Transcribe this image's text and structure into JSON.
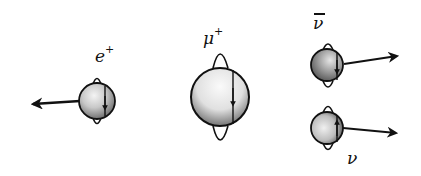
{
  "diagram": {
    "type": "particle-spin-helicity",
    "particles": [
      {
        "id": "positron",
        "symbol": "e",
        "superscript": "+",
        "label": "e+",
        "spin_direction": "down",
        "momentum_direction": "left"
      },
      {
        "id": "muon",
        "symbol": "μ",
        "superscript": "+",
        "label": "μ+",
        "spin_direction": "down",
        "momentum_direction": "none"
      },
      {
        "id": "antineutrino",
        "symbol": "ν",
        "overbar": true,
        "label": "ν̄",
        "spin_direction": "down",
        "momentum_direction": "right"
      },
      {
        "id": "neutrino",
        "symbol": "ν",
        "label": "ν",
        "spin_direction": "up",
        "momentum_direction": "right"
      }
    ],
    "colors": {
      "ink": "#111111",
      "sphere_shadow": "#5a5a5a",
      "sphere_light": "#e8e8e8",
      "background": "#ffffff"
    }
  }
}
